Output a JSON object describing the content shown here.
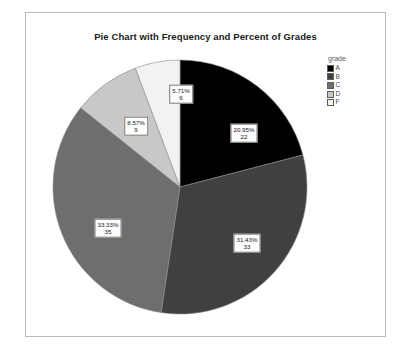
{
  "chart": {
    "title": "Pie Chart with Frequency and Percent of Grades"
  },
  "legend": {
    "title": "grade",
    "items": [
      {
        "label": "A",
        "color": "#000000"
      },
      {
        "label": "B",
        "color": "#404040"
      },
      {
        "label": "C",
        "color": "#6e6e6e"
      },
      {
        "label": "D",
        "color": "#c8c8c8"
      },
      {
        "label": "F",
        "color": "#f2f2f2"
      }
    ]
  },
  "chart_data": {
    "type": "pie",
    "title": "Pie Chart with Frequency and Percent of Grades",
    "legend_title": "grade",
    "legend_position": "right",
    "start_angle_deg": 0,
    "direction": "clockwise",
    "total": 105,
    "categories": [
      "A",
      "B",
      "C",
      "D",
      "F"
    ],
    "values": [
      22,
      33,
      35,
      9,
      6
    ],
    "percents": [
      20.95,
      31.43,
      33.33,
      8.57,
      5.71
    ],
    "percent_labels": [
      "20.95%",
      "31.43%",
      "33.33%",
      "8.57%",
      "5.71%"
    ],
    "count_labels": [
      "22",
      "33",
      "35",
      "9",
      "6"
    ],
    "colors": [
      "#000000",
      "#404040",
      "#6e6e6e",
      "#c8c8c8",
      "#f2f2f2"
    ],
    "xlabel": "",
    "ylabel": ""
  },
  "slice_labels": [
    {
      "pct": "20.95%",
      "cnt": "22",
      "x": 218,
      "y": 120
    },
    {
      "pct": "31.43%",
      "cnt": "33",
      "x": 221,
      "y": 230
    },
    {
      "pct": "33.33%",
      "cnt": "35",
      "x": 82,
      "y": 215
    },
    {
      "pct": "8.57%",
      "cnt": "9",
      "x": 110,
      "y": 113
    },
    {
      "pct": "5.71%",
      "cnt": "6",
      "x": 155,
      "y": 81
    }
  ]
}
